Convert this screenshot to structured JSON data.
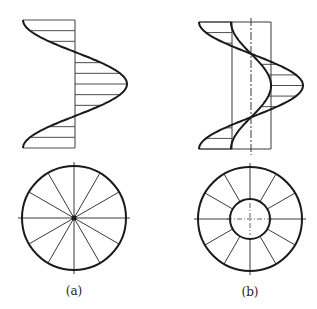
{
  "figure": {
    "stroke_color": "#1a1a1a",
    "thin_color": "#3a3a3a",
    "background": "#ffffff"
  },
  "panels": [
    {
      "id": "a",
      "caption": "(a)",
      "caption_pos": [
        74,
        284
      ],
      "elevation": {
        "axis_x": 75,
        "top_y": 20,
        "bottom_y": 148,
        "amplitude": 52,
        "hatch_count": 13,
        "description": "single helix curve with hatching to axis"
      },
      "plan": {
        "center": [
          74,
          218
        ],
        "outer_radius": 52,
        "inner_radius": 0,
        "divisions": 12,
        "center_line_extent": 56
      }
    },
    {
      "id": "b",
      "caption": "(b)",
      "caption_pos": [
        250,
        285
      ],
      "elevation": {
        "axis_x": 251,
        "top_y": 22,
        "bottom_y": 149,
        "outer_amplitude": 52,
        "inner_amplitude": 20,
        "box_left": 232,
        "box_right": 271,
        "hatch_count": 13,
        "description": "outer and inner helix curves with bounding box and dash-dot center line"
      },
      "plan": {
        "center": [
          250,
          219
        ],
        "outer_radius": 52,
        "inner_radius": 20,
        "divisions": 12,
        "center_line_extent": 56
      }
    }
  ]
}
